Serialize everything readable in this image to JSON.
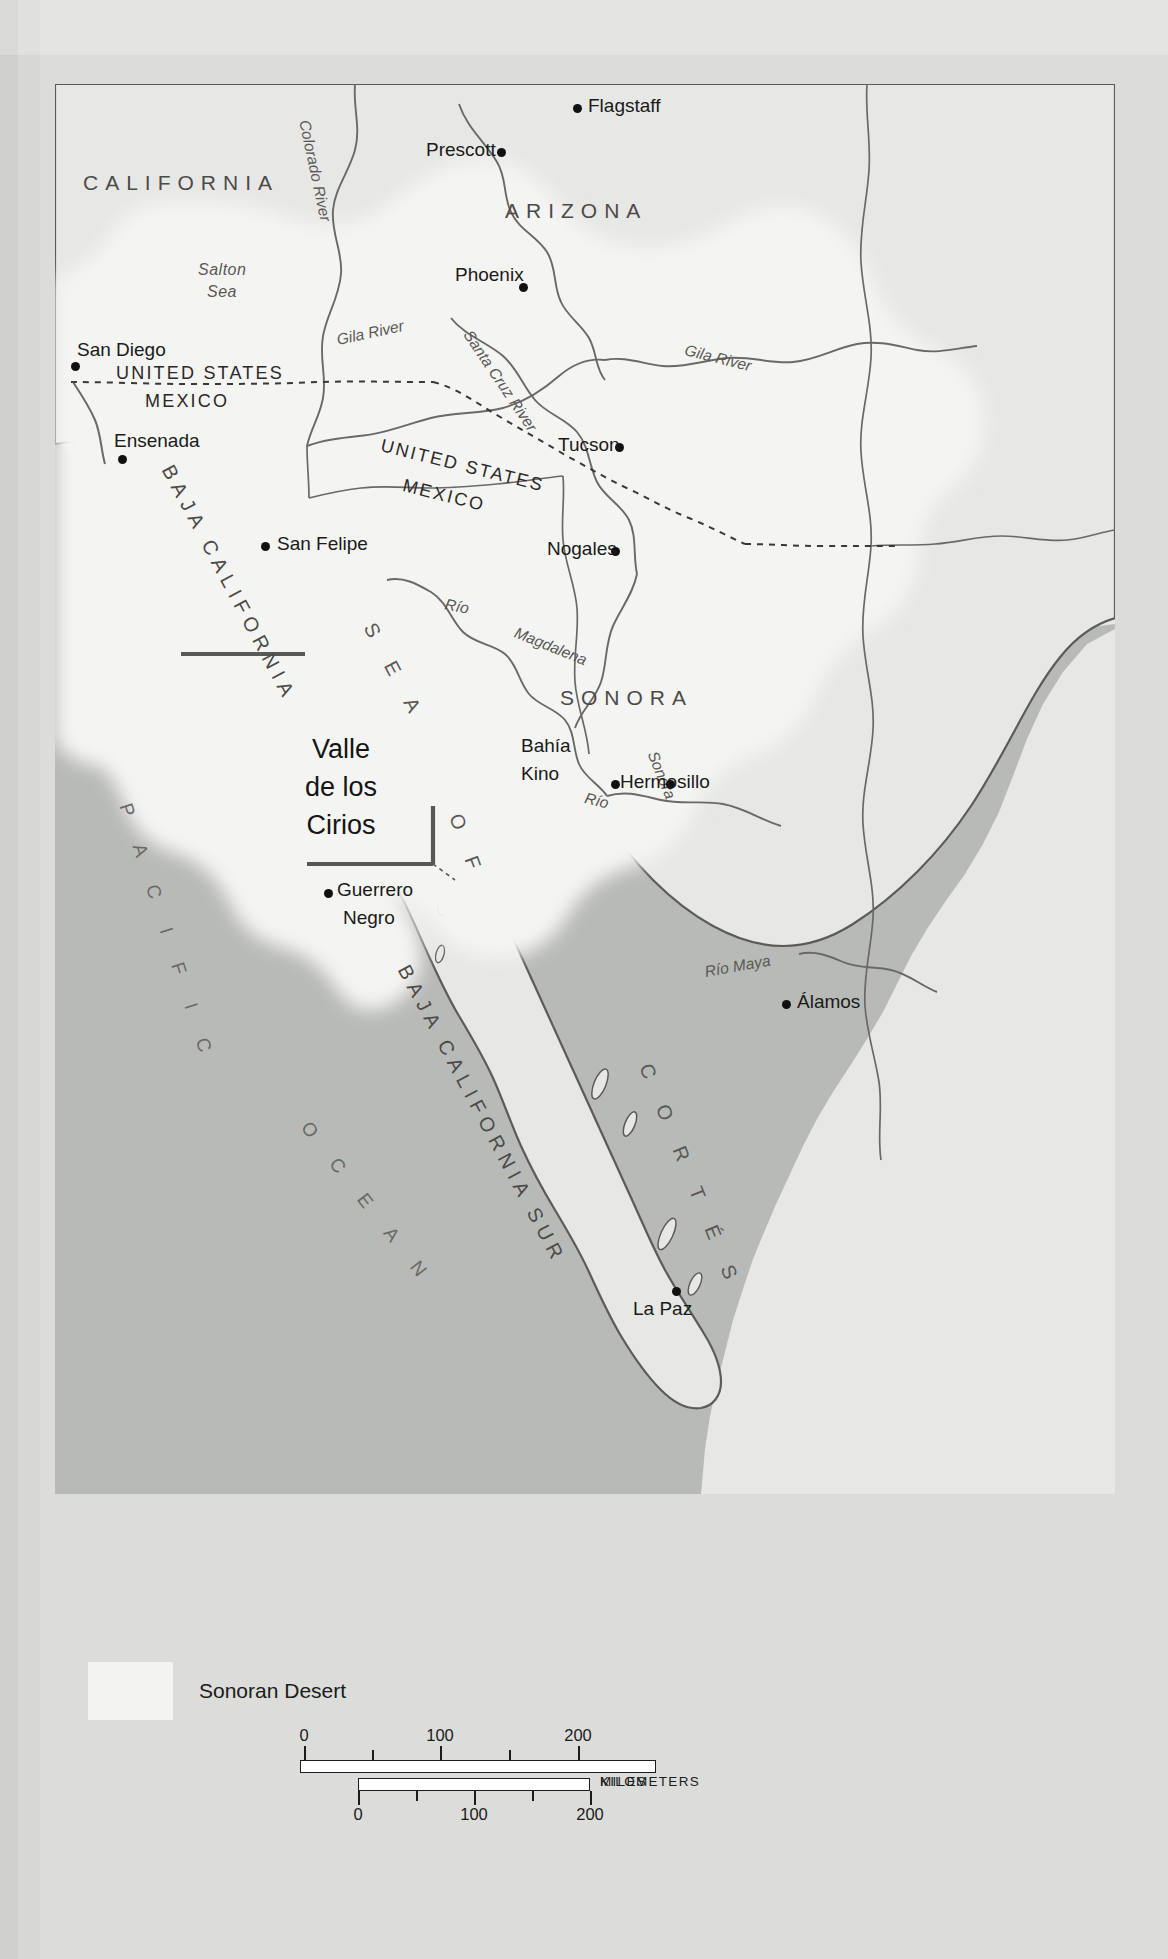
{
  "map": {
    "title": "Sonoran Desert region map",
    "states": [
      {
        "name": "CALIFORNIA",
        "x": 80,
        "y": 92
      },
      {
        "name": "ARIZONA",
        "x": 455,
        "y": 118
      },
      {
        "name": "SONORA",
        "x": 510,
        "y": 605
      },
      {
        "name": "BAJA CALIFORNIA",
        "x": 0,
        "y": 0
      },
      {
        "name": "BAJA CALIFORNIA SUR",
        "x": 0,
        "y": 0
      }
    ],
    "cities": [
      {
        "name": "Flagstaff",
        "x": 519,
        "y": 27,
        "label_dx": 14,
        "label_dy": -9
      },
      {
        "name": "Prescott",
        "x": 443,
        "y": 72,
        "label_dx": -95,
        "label_dy": -9
      },
      {
        "name": "Phoenix",
        "x": 464,
        "y": 201,
        "label_dx": -93,
        "label_dy": -13
      },
      {
        "name": "San Diego",
        "x": 18,
        "y": 281,
        "label_dx": 10,
        "label_dy": -22
      },
      {
        "name": "Ensenada",
        "x": 65,
        "y": 372,
        "label_dx": -5,
        "label_dy": -24
      },
      {
        "name": "Tucson",
        "x": 561,
        "y": 361,
        "label_dx": -88,
        "label_dy": -10
      },
      {
        "name": "Nogales",
        "x": 557,
        "y": 464,
        "label_dx": -92,
        "label_dy": -10
      },
      {
        "name": "San Felipe",
        "x": 208,
        "y": 459,
        "label_dx": 14,
        "label_dy": -10
      },
      {
        "name": "Bahía Kino",
        "x": 556,
        "y": 697,
        "label_dx": -70,
        "label_dy": -52
      },
      {
        "name": "Hermosillo",
        "x": 556,
        "y": 697,
        "label_dx": 14,
        "label_dy": -10
      },
      {
        "name": "Guerrero Negro",
        "x": 271,
        "y": 806,
        "label_dx": 14,
        "label_dy": -10
      },
      {
        "name": "Álamos",
        "x": 727,
        "y": 917,
        "label_dx": 14,
        "label_dy": -10
      },
      {
        "name": "La Paz",
        "x": 619,
        "y": 1204,
        "label_dx": -68,
        "label_dy": 9
      }
    ],
    "water_labels": [
      {
        "name": "Salton Sea"
      },
      {
        "name": "SEA"
      },
      {
        "name": "OF"
      },
      {
        "name": "CORTÉS"
      },
      {
        "name": "PACIFIC"
      },
      {
        "name": "OCEAN"
      }
    ],
    "rivers": [
      {
        "name": "Colorado River"
      },
      {
        "name": "Gila River"
      },
      {
        "name": "Gila River"
      },
      {
        "name": "Santa Cruz River"
      },
      {
        "name": "Río"
      },
      {
        "name": "Magdalena"
      },
      {
        "name": "Río"
      },
      {
        "name": "Sonora"
      },
      {
        "name": "Río Maya"
      }
    ],
    "borders": [
      {
        "top": "UNITED STATES",
        "bottom": "MEXICO"
      },
      {
        "top": "UNITED STATES",
        "bottom": "MEXICO"
      }
    ],
    "protected_area": {
      "line1": "Valle",
      "line2": "de los",
      "line3": "Cirios"
    }
  },
  "legend": {
    "swatch_label": "Sonoran Desert",
    "swatch_color": "#f3f3f1"
  },
  "scale": {
    "miles": {
      "unit": "MILES",
      "labels": [
        "0",
        "100",
        "200"
      ],
      "max": 260
    },
    "kilometers": {
      "unit": "KILOMETERS",
      "labels": [
        "0",
        "100",
        "200"
      ],
      "max": 250
    }
  },
  "colors": {
    "water": "#b8bab7",
    "land": "#e7e8e5",
    "desert": "#f4f4f2",
    "page": "#dcddda",
    "ink": "#231f20",
    "boundary": "#5d5b59",
    "reserve_line": "#5a5856"
  },
  "labels": {
    "california": "CALIFORNIA",
    "arizona": "ARIZONA",
    "sonora": "SONORA",
    "baja_california": "BAJA CALIFORNIA",
    "baja_california_sur": "BAJA CALIFORNIA SUR",
    "salton_sea_1": "Salton",
    "salton_sea_2": "Sea",
    "sea": "S E A",
    "of": "O F",
    "cortes": "C O R T É S",
    "pacific": "P A C I F I C",
    "ocean": "O C E A N",
    "colorado_river": "Colorado River",
    "gila_river_1": "Gila River",
    "gila_river_2": "Gila River",
    "santa_cruz_river": "Santa Cruz River",
    "rio_1": "Río",
    "magdalena": "Magdalena",
    "rio_2": "Río",
    "sonora_river": "Sonora",
    "rio_maya": "Río Maya",
    "us_1": "UNITED STATES",
    "mx_1": "MEXICO",
    "us_2": "UNITED STATES",
    "mx_2": "MEXICO",
    "flagstaff": "Flagstaff",
    "prescott": "Prescott",
    "phoenix": "Phoenix",
    "san_diego": "San Diego",
    "ensenada": "Ensenada",
    "tucson": "Tucson",
    "nogales": "Nogales",
    "san_felipe": "San Felipe",
    "bahia": "Bahía",
    "kino": "Kino",
    "hermosillo": "Hermosillo",
    "guerrero": "Guerrero",
    "negro": "Negro",
    "alamos": "Álamos",
    "la_paz": "La Paz",
    "valle": "Valle",
    "de_los": "de los",
    "cirios": "Cirios"
  }
}
